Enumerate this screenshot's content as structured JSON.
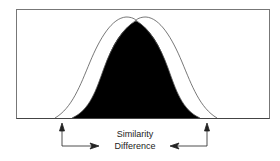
{
  "diagram": {
    "type": "overlapping-distribution-curves",
    "labels": {
      "similarity": "Similarity",
      "difference": "Difference"
    },
    "colors": {
      "frame": "#777777",
      "outline_curves": "#555555",
      "overlap_fill": "#000000",
      "arrows": "#222222",
      "background": "#ffffff"
    },
    "elements": [
      {
        "name": "left-outline-curve",
        "description": "Bell curve shifted left, outline only"
      },
      {
        "name": "right-outline-curve",
        "description": "Bell curve shifted right, outline only"
      },
      {
        "name": "overlap-region",
        "description": "Black filled intersection of the two curves"
      },
      {
        "name": "left-arrow",
        "description": "Arrow from left curve tail pointing right toward labels"
      },
      {
        "name": "right-arrow",
        "description": "Arrow from right curve tail pointing left toward labels"
      }
    ]
  }
}
